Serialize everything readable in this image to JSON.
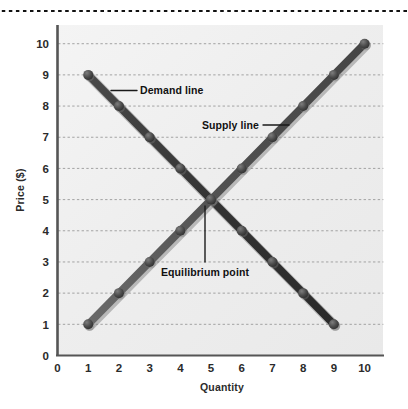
{
  "figure": {
    "background": "#ffffff",
    "plot_background": "#efefef",
    "top_rule": {
      "name": "dotted-rule",
      "color": "#111111"
    }
  },
  "chart_data": {
    "type": "line",
    "title": "",
    "xlabel": "Quantity",
    "ylabel": "Price ($)",
    "xlim": [
      0,
      10.6
    ],
    "ylim": [
      0,
      10.6
    ],
    "xticks": [
      0,
      1,
      2,
      3,
      4,
      5,
      6,
      7,
      8,
      9,
      10
    ],
    "yticks": [
      0,
      1,
      2,
      3,
      4,
      5,
      6,
      7,
      8,
      9,
      10
    ],
    "xtick_labels": [
      "0",
      "1",
      "2",
      "3",
      "4",
      "5",
      "6",
      "7",
      "8",
      "9",
      "10"
    ],
    "ytick_labels": [
      "0",
      "1",
      "2",
      "3",
      "4",
      "5",
      "6",
      "7",
      "8",
      "9",
      "10"
    ],
    "grid": "horizontal-dotted",
    "legend": "none",
    "series": [
      {
        "name": "Demand line",
        "color": "#3a3a3a",
        "marker": "circle",
        "x": [
          1,
          2,
          3,
          4,
          5,
          6,
          7,
          8,
          9
        ],
        "y": [
          9,
          8,
          7,
          6,
          5,
          4,
          3,
          2,
          1
        ]
      },
      {
        "name": "Supply line",
        "color": "#5a5a5a",
        "marker": "circle",
        "x": [
          1,
          2,
          3,
          4,
          5,
          6,
          7,
          8,
          9,
          10
        ],
        "y": [
          1,
          2,
          3,
          4,
          5,
          6,
          7,
          8,
          9,
          10
        ]
      }
    ],
    "annotations": [
      {
        "name": "demand-line-label",
        "text": "Demand line",
        "x": 2.6,
        "y": 8.65
      },
      {
        "name": "supply-line-label",
        "text": "Supply line",
        "x": 5.0,
        "y": 7.75
      },
      {
        "name": "equilibrium-point-label",
        "text": "Equilibrium point",
        "x": 5.0,
        "y": 2.75
      }
    ],
    "equilibrium": {
      "x": 5,
      "y": 5
    }
  }
}
